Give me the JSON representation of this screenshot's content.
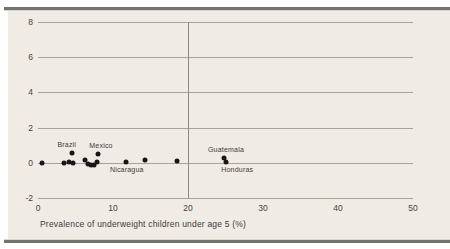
{
  "page": {
    "background": "#ffffff",
    "rule_color": "#73726e",
    "panel_color": "#f1ebe6"
  },
  "chart_data": {
    "type": "scatter",
    "title": "",
    "xlabel": "Prevalence of underweight children under age 5 (%)",
    "ylabel": "",
    "xlim": [
      0,
      50
    ],
    "ylim": [
      -2,
      8
    ],
    "xticks": [
      0,
      10,
      20,
      30,
      40,
      50
    ],
    "yticks": [
      8,
      6,
      4,
      2,
      0,
      -2
    ],
    "grid": "horizontal gridlines only",
    "legend": "none",
    "reference_line_x": 20,
    "point_color": "#161616",
    "grid_color": "#a8a29c",
    "points": [
      {
        "x": 0.5,
        "y": 0.0
      },
      {
        "x": 3.5,
        "y": -0.02
      },
      {
        "x": 4.1,
        "y": 0.02
      },
      {
        "x": 4.5,
        "y": 0.55,
        "label": "Brazil",
        "label_pos": "above",
        "label_dx": -5
      },
      {
        "x": 4.6,
        "y": -0.02
      },
      {
        "x": 6.2,
        "y": 0.18
      },
      {
        "x": 6.6,
        "y": -0.08
      },
      {
        "x": 7.0,
        "y": -0.15
      },
      {
        "x": 7.4,
        "y": -0.12
      },
      {
        "x": 7.8,
        "y": 0.02
      },
      {
        "x": 8.0,
        "y": 0.52,
        "label": "Mexico",
        "label_pos": "above",
        "label_dx": 3
      },
      {
        "x": 11.7,
        "y": 0.03,
        "label": "Nicaragua",
        "label_pos": "below",
        "label_dx": 1
      },
      {
        "x": 14.2,
        "y": 0.15
      },
      {
        "x": 18.5,
        "y": 0.08
      },
      {
        "x": 24.8,
        "y": 0.28,
        "label": "Guatemala",
        "label_pos": "above",
        "label_dx": 2
      },
      {
        "x": 25.1,
        "y": 0.05,
        "label": "Honduras",
        "label_pos": "below",
        "label_dx": 11
      }
    ]
  }
}
